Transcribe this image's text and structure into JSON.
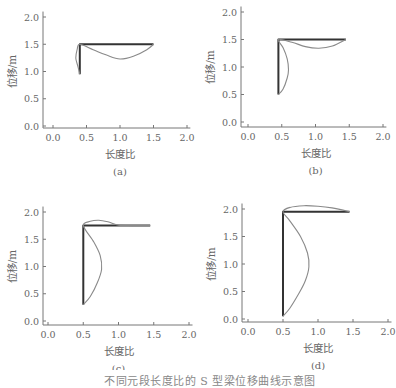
{
  "figure": {
    "caption": "不同元段长度比的 S 型梁位移曲线示意图",
    "panels": [
      {
        "label": "(a)",
        "xlabel": "长度比",
        "ylabel": "位移/m"
      },
      {
        "label": "(b)",
        "xlabel": "长度比",
        "ylabel": "位移/m"
      },
      {
        "label": "(c)",
        "xlabel": "长度比",
        "ylabel": "位移/m"
      },
      {
        "label": "(d)",
        "xlabel": "长度比",
        "ylabel": "位移/m"
      }
    ]
  },
  "chart_data": [
    {
      "type": "line",
      "title": "(a)",
      "xlabel": "长度比",
      "ylabel": "位移/m",
      "xlim": [
        0.0,
        2.0
      ],
      "ylim": [
        0.0,
        2.0
      ],
      "xticks": [
        "0.0",
        "0.5",
        "1.0",
        "1.5",
        "2.0"
      ],
      "yticks": [
        "0.0",
        "0.5",
        "1.0",
        "1.5",
        "2.0"
      ],
      "grid": false,
      "series": [
        {
          "name": "undeformed",
          "style": "thick-dark",
          "points": [
            [
              0.4,
              0.95
            ],
            [
              0.4,
              1.5
            ],
            [
              1.5,
              1.5
            ]
          ]
        },
        {
          "name": "deformed",
          "style": "thin-grey",
          "points": [
            [
              0.4,
              0.95
            ],
            [
              0.37,
              1.1
            ],
            [
              0.34,
              1.25
            ],
            [
              0.36,
              1.4
            ],
            [
              0.4,
              1.5
            ],
            [
              0.6,
              1.4
            ],
            [
              0.8,
              1.3
            ],
            [
              1.0,
              1.23
            ],
            [
              1.2,
              1.28
            ],
            [
              1.4,
              1.4
            ],
            [
              1.5,
              1.5
            ]
          ]
        }
      ]
    },
    {
      "type": "line",
      "title": "(b)",
      "xlabel": "长度比",
      "ylabel": "位移/m",
      "xlim": [
        0.0,
        2.0
      ],
      "ylim": [
        0.0,
        2.0
      ],
      "xticks": [
        "0.0",
        "0.5",
        "1.0",
        "1.5",
        "2.0"
      ],
      "yticks": [
        "0.0",
        "0.5",
        "1.0",
        "1.5",
        "2.0"
      ],
      "grid": false,
      "series": [
        {
          "name": "undeformed",
          "style": "thick-dark",
          "points": [
            [
              0.45,
              0.5
            ],
            [
              0.45,
              1.5
            ],
            [
              1.45,
              1.5
            ]
          ]
        },
        {
          "name": "deformed",
          "style": "thin-grey",
          "points": [
            [
              0.45,
              0.5
            ],
            [
              0.52,
              0.6
            ],
            [
              0.58,
              0.8
            ],
            [
              0.6,
              0.95
            ],
            [
              0.58,
              1.15
            ],
            [
              0.52,
              1.35
            ],
            [
              0.45,
              1.5
            ],
            [
              0.65,
              1.45
            ],
            [
              0.85,
              1.37
            ],
            [
              1.05,
              1.34
            ],
            [
              1.25,
              1.38
            ],
            [
              1.45,
              1.5
            ]
          ]
        }
      ]
    },
    {
      "type": "line",
      "title": "(c)",
      "xlabel": "长度比",
      "ylabel": "位移/m",
      "xlim": [
        0.0,
        2.0
      ],
      "ylim": [
        0.0,
        2.0
      ],
      "xticks": [
        "0.0",
        "0.5",
        "1.0",
        "1.5",
        "2.0"
      ],
      "yticks": [
        "0.0",
        "0.5",
        "1.0",
        "1.5",
        "2.0"
      ],
      "grid": false,
      "series": [
        {
          "name": "undeformed",
          "style": "thick-dark",
          "points": [
            [
              0.5,
              0.3
            ],
            [
              0.5,
              1.75
            ],
            [
              1.45,
              1.75
            ]
          ]
        },
        {
          "name": "deformed",
          "style": "thin-grey",
          "points": [
            [
              0.5,
              0.3
            ],
            [
              0.6,
              0.45
            ],
            [
              0.7,
              0.7
            ],
            [
              0.76,
              0.95
            ],
            [
              0.74,
              1.2
            ],
            [
              0.65,
              1.45
            ],
            [
              0.5,
              1.75
            ],
            [
              0.6,
              1.83
            ],
            [
              0.72,
              1.85
            ],
            [
              0.85,
              1.82
            ],
            [
              1.0,
              1.76
            ],
            [
              1.2,
              1.75
            ],
            [
              1.45,
              1.75
            ]
          ]
        }
      ]
    },
    {
      "type": "line",
      "title": "(d)",
      "xlabel": "长度比",
      "ylabel": "位移/m",
      "xlim": [
        0.0,
        2.0
      ],
      "ylim": [
        0.0,
        2.0
      ],
      "xticks": [
        "0.0",
        "0.5",
        "1.0",
        "1.5",
        "2.0"
      ],
      "yticks": [
        "0.0",
        "0.5",
        "1.0",
        "1.5",
        "2.0"
      ],
      "grid": false,
      "series": [
        {
          "name": "undeformed",
          "style": "thick-dark",
          "points": [
            [
              0.5,
              0.05
            ],
            [
              0.5,
              1.95
            ],
            [
              1.45,
              1.95
            ]
          ]
        },
        {
          "name": "deformed",
          "style": "thin-grey",
          "points": [
            [
              0.5,
              0.05
            ],
            [
              0.6,
              0.2
            ],
            [
              0.72,
              0.45
            ],
            [
              0.82,
              0.7
            ],
            [
              0.87,
              0.95
            ],
            [
              0.85,
              1.2
            ],
            [
              0.75,
              1.5
            ],
            [
              0.6,
              1.78
            ],
            [
              0.5,
              1.95
            ],
            [
              0.6,
              2.03
            ],
            [
              0.8,
              2.06
            ],
            [
              1.0,
              2.05
            ],
            [
              1.2,
              2.02
            ],
            [
              1.45,
              1.95
            ]
          ]
        }
      ]
    }
  ],
  "layout": {
    "panels": [
      {
        "left": 0,
        "top": 0,
        "x0": 53,
        "x2": 187,
        "y0": 126,
        "y2": 17,
        "axisX": 43,
        "axisY": 128
      },
      {
        "left": 196,
        "top": 0,
        "x0": 52,
        "x2": 187,
        "y0": 122,
        "y2": 12,
        "axisX": 45,
        "axisY": 127
      },
      {
        "left": 0,
        "top": 185,
        "x0": 48,
        "x2": 189,
        "y0": 136,
        "y2": 27,
        "axisX": 43,
        "axisY": 140
      },
      {
        "left": 196,
        "top": 185,
        "x0": 52,
        "x2": 192,
        "y0": 134,
        "y2": 24,
        "axisX": 46,
        "axisY": 137
      }
    ],
    "colors": {
      "axis": "#777777",
      "thick": "#333333",
      "thin": "#8a8a8a",
      "text": "#666666"
    }
  }
}
